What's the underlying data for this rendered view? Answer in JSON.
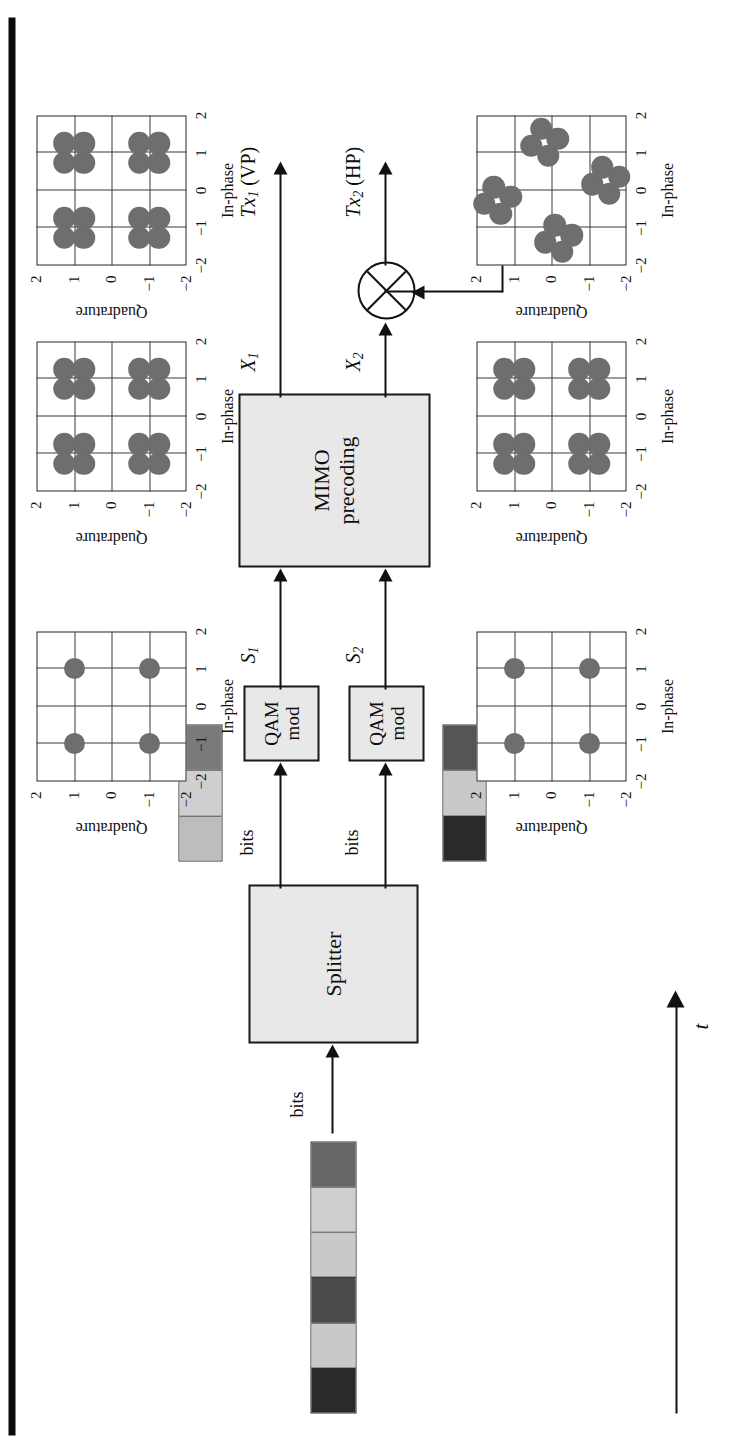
{
  "figure": {
    "type": "block-diagram",
    "orientation": "rotated-90-ccw",
    "time_axis_label": "t"
  },
  "blocks": [
    {
      "id": "splitter",
      "label": "Splitter"
    },
    {
      "id": "qam1",
      "label_line1": "QAM",
      "label_line2": "mod"
    },
    {
      "id": "qam2",
      "label_line1": "QAM",
      "label_line2": "mod"
    },
    {
      "id": "mimo",
      "label_line1": "MIMO",
      "label_line2": "precoding"
    }
  ],
  "signals": {
    "input_bits": "bits",
    "bits_branch1": "bits",
    "bits_branch2": "bits",
    "s1": "S",
    "s1_sub": "1",
    "s2": "S",
    "s2_sub": "2",
    "x1": "X",
    "x1_sub": "1",
    "x2": "X",
    "x2_sub": "2",
    "tx1": "Tx",
    "tx1_sub": "1",
    "tx1_pol": "(VP)",
    "tx2": "Tx",
    "tx2_sub": "2",
    "tx2_pol": "(HP)",
    "phase_rotator_base": "e",
    "phase_rotator_exp": "jφ(i)"
  },
  "bit_strips": [
    {
      "id": "input-stream",
      "segments": [
        "#2a2a2a",
        "#c9c9c9",
        "#4a4a4a",
        "#c9c9c9",
        "#cfcfcf",
        "#666666"
      ]
    },
    {
      "id": "branch1-stream",
      "segments": [
        "#bdbdbd",
        "#cfcfcf",
        "#7a7a7a"
      ]
    },
    {
      "id": "branch2-stream",
      "segments": [
        "#2a2a2a",
        "#c9c9c9",
        "#555555"
      ]
    }
  ],
  "constellations": [
    {
      "id": "s1-qpsk",
      "title_role": "S1 QPSK constellation",
      "xlabel": "In-phase",
      "ylabel": "Quadrature",
      "xticks": [
        "-2",
        "-1",
        "0",
        "1",
        "2"
      ],
      "yticks": [
        "-2",
        "-1",
        "0",
        "1",
        "2"
      ],
      "xlim": [
        -2,
        2
      ],
      "ylim": [
        -2,
        2
      ],
      "point_radius": 0.28,
      "points": [
        [
          -1,
          -1
        ],
        [
          -1,
          1
        ],
        [
          1,
          -1
        ],
        [
          1,
          1
        ]
      ]
    },
    {
      "id": "s2-qpsk",
      "title_role": "S2 QPSK constellation",
      "xlabel": "In-phase",
      "ylabel": "Quadrature",
      "xticks": [
        "-2",
        "-1",
        "0",
        "1",
        "2"
      ],
      "yticks": [
        "-2",
        "-1",
        "0",
        "1",
        "2"
      ],
      "xlim": [
        -2,
        2
      ],
      "ylim": [
        -2,
        2
      ],
      "point_radius": 0.28,
      "points": [
        [
          -1,
          -1
        ],
        [
          -1,
          1
        ],
        [
          1,
          -1
        ],
        [
          1,
          1
        ]
      ]
    },
    {
      "id": "x1-precoded",
      "title_role": "X1 precoded constellation",
      "xlabel": "In-phase",
      "ylabel": "Quadrature",
      "xticks": [
        "-2",
        "-1",
        "0",
        "1",
        "2"
      ],
      "yticks": [
        "-2",
        "-1",
        "0",
        "1",
        "2"
      ],
      "xlim": [
        -2,
        2
      ],
      "ylim": [
        -2,
        2
      ],
      "point_radius": 0.3,
      "points": [
        [
          -1.26,
          -1.26
        ],
        [
          -0.74,
          -1.26
        ],
        [
          -1.26,
          -0.74
        ],
        [
          -0.74,
          -0.74
        ],
        [
          0.74,
          -1.26
        ],
        [
          1.26,
          -1.26
        ],
        [
          0.74,
          -0.74
        ],
        [
          1.26,
          -0.74
        ],
        [
          -1.26,
          0.74
        ],
        [
          -0.74,
          0.74
        ],
        [
          -1.26,
          1.26
        ],
        [
          -0.74,
          1.26
        ],
        [
          0.74,
          0.74
        ],
        [
          1.26,
          0.74
        ],
        [
          0.74,
          1.26
        ],
        [
          1.26,
          1.26
        ]
      ]
    },
    {
      "id": "tx1-vp",
      "title_role": "Tx1 (VP) constellation",
      "xlabel": "In-phase",
      "ylabel": "Quadrature",
      "xticks": [
        "-2",
        "-1",
        "0",
        "1",
        "2"
      ],
      "yticks": [
        "-2",
        "-1",
        "0",
        "1",
        "2"
      ],
      "xlim": [
        -2,
        2
      ],
      "ylim": [
        -2,
        2
      ],
      "point_radius": 0.3,
      "points": [
        [
          -1.26,
          -1.26
        ],
        [
          -0.74,
          -1.26
        ],
        [
          -1.26,
          -0.74
        ],
        [
          -0.74,
          -0.74
        ],
        [
          0.74,
          -1.26
        ],
        [
          1.26,
          -1.26
        ],
        [
          0.74,
          -0.74
        ],
        [
          1.26,
          -0.74
        ],
        [
          -1.26,
          0.74
        ],
        [
          -0.74,
          0.74
        ],
        [
          -1.26,
          1.26
        ],
        [
          -0.74,
          1.26
        ],
        [
          0.74,
          0.74
        ],
        [
          1.26,
          0.74
        ],
        [
          0.74,
          1.26
        ],
        [
          1.26,
          1.26
        ]
      ]
    },
    {
      "id": "x2-precoded",
      "title_role": "X2 precoded constellation",
      "xlabel": "In-phase",
      "ylabel": "Quadrature",
      "xticks": [
        "-2",
        "-1",
        "0",
        "1",
        "2"
      ],
      "yticks": [
        "-2",
        "-1",
        "0",
        "1",
        "2"
      ],
      "xlim": [
        -2,
        2
      ],
      "ylim": [
        -2,
        2
      ],
      "point_radius": 0.3,
      "points": [
        [
          -1.26,
          -1.26
        ],
        [
          -0.74,
          -1.26
        ],
        [
          -1.26,
          -0.74
        ],
        [
          -0.74,
          -0.74
        ],
        [
          0.74,
          -1.26
        ],
        [
          1.26,
          -1.26
        ],
        [
          0.74,
          -0.74
        ],
        [
          1.26,
          -0.74
        ],
        [
          -1.26,
          0.74
        ],
        [
          -0.74,
          0.74
        ],
        [
          -1.26,
          1.26
        ],
        [
          -0.74,
          1.26
        ],
        [
          0.74,
          0.74
        ],
        [
          1.26,
          0.74
        ],
        [
          0.74,
          1.26
        ],
        [
          1.26,
          1.26
        ]
      ]
    },
    {
      "id": "tx2-hp",
      "title_role": "Tx2 (HP) rotated constellation",
      "xlabel": "In-phase",
      "ylabel": "Quadrature",
      "xticks": [
        "-2",
        "-1",
        "0",
        "1",
        "2"
      ],
      "yticks": [
        "-2",
        "-1",
        "0",
        "1",
        "2"
      ],
      "xlim": [
        -2,
        2
      ],
      "ylim": [
        -2,
        2
      ],
      "point_radius": 0.3,
      "rotation_deg": 28,
      "points": [
        [
          -1.64,
          -0.28
        ],
        [
          -1.19,
          -0.54
        ],
        [
          -1.38,
          0.17
        ],
        [
          -0.93,
          -0.09
        ],
        [
          -0.09,
          -1.54
        ],
        [
          0.36,
          -1.8
        ],
        [
          0.17,
          -1.09
        ],
        [
          0.62,
          -1.35
        ],
        [
          -0.62,
          1.35
        ],
        [
          -0.17,
          1.09
        ],
        [
          -0.36,
          1.8
        ],
        [
          0.09,
          1.54
        ],
        [
          0.93,
          0.09
        ],
        [
          1.38,
          -0.17
        ],
        [
          1.19,
          0.54
        ],
        [
          1.64,
          0.28
        ]
      ]
    }
  ]
}
